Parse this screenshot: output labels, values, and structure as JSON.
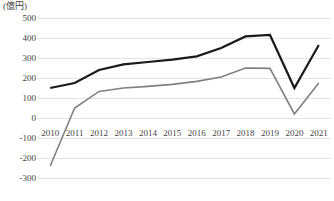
{
  "chart_data": {
    "type": "line",
    "title": "",
    "subtitle": "",
    "xlabel": "",
    "ylabel": "",
    "unit_label": "(億円)",
    "categories": [
      "2010",
      "2011",
      "2012",
      "2013",
      "2014",
      "2015",
      "2016",
      "2017",
      "2018",
      "2019",
      "2020",
      "2021"
    ],
    "x": [
      2010,
      2011,
      2012,
      2013,
      2014,
      2015,
      2016,
      2017,
      2018,
      2019,
      2020,
      2021
    ],
    "series": [
      {
        "name": "black-series",
        "color": "#1a1a1a",
        "stroke_width": 2.2,
        "values": [
          150,
          175,
          240,
          268,
          280,
          292,
          308,
          350,
          408,
          415,
          150,
          365
        ]
      },
      {
        "name": "gray-series",
        "color": "#808080",
        "stroke_width": 1.6,
        "values": [
          -240,
          50,
          133,
          150,
          158,
          168,
          183,
          205,
          250,
          248,
          20,
          175
        ]
      }
    ],
    "ylim": [
      -300,
      500
    ],
    "yticks": [
      500,
      400,
      300,
      200,
      100,
      0,
      -100,
      -200,
      -300
    ],
    "ytick_labels": [
      "500",
      "400",
      "300",
      "200",
      "100",
      "0",
      "-100",
      "-200",
      "-300"
    ],
    "grid": true,
    "grid_axis": "y",
    "grid_color": "#e4e4e4",
    "legend": false,
    "legend_position": "none",
    "background_color": "#ffffff",
    "axis_text_color": "#3f3f3f"
  }
}
